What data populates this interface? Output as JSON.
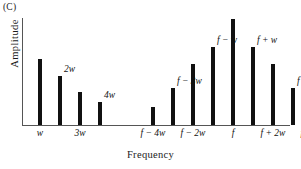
{
  "panel": {
    "label": "(C)"
  },
  "axes": {
    "ylabel": "Amplitude",
    "xlabel": "Frequency"
  },
  "chart_data": {
    "type": "bar",
    "title": "",
    "subtitle": "",
    "xlabel": "Frequency",
    "ylabel": "Amplitude",
    "ylim": [
      0,
      100
    ],
    "grid": false,
    "legend": null,
    "annotations": [
      "(C)"
    ],
    "categories": [
      "w",
      "2w",
      "3w",
      "4w",
      "f - 4w",
      "f - 3w",
      "f - 2w",
      "f - w",
      "f",
      "f + w",
      "f + 2w",
      "f + 3w",
      "f + 4w"
    ],
    "values": [
      62,
      46,
      31,
      22,
      17,
      35,
      58,
      74,
      100,
      74,
      58,
      35,
      17
    ],
    "tick_labels_below": [
      "w",
      "3w",
      "f - 4w",
      "f - 2w",
      "f",
      "f + 2w",
      "f + 4w"
    ],
    "labels_above": [
      "2w",
      "4w",
      "f - 3w",
      "f - w",
      "f + w",
      "f + 3w"
    ],
    "groups": [
      {
        "name": "baseband",
        "categories": [
          "w",
          "2w",
          "3w",
          "4w"
        ]
      },
      {
        "name": "carrier-sidebands",
        "categories": [
          "f - 4w",
          "f - 3w",
          "f - 2w",
          "f - w",
          "f",
          "f + w",
          "f + 2w",
          "f + 3w",
          "f + 4w"
        ]
      }
    ]
  },
  "bars": [
    {
      "name": "w",
      "label": "w",
      "value": 62,
      "x": 18,
      "label_pos": "below"
    },
    {
      "name": "2w",
      "label": "2w",
      "value": 46,
      "x": 38,
      "label_pos": "above"
    },
    {
      "name": "3w",
      "label": "3w",
      "value": 31,
      "x": 58,
      "label_pos": "below"
    },
    {
      "name": "4w",
      "label": "4w",
      "value": 22,
      "x": 78,
      "label_pos": "above"
    },
    {
      "name": "f-4w",
      "label": "f − 4w",
      "value": 17,
      "x": 131,
      "label_pos": "below"
    },
    {
      "name": "f-3w",
      "label": "f − 3w",
      "value": 35,
      "x": 151,
      "label_pos": "above"
    },
    {
      "name": "f-2w",
      "label": "f − 2w",
      "value": 58,
      "x": 171,
      "label_pos": "below"
    },
    {
      "name": "f-w",
      "label": "f − w",
      "value": 74,
      "x": 191,
      "label_pos": "above"
    },
    {
      "name": "f",
      "label": "f",
      "value": 100,
      "x": 211,
      "label_pos": "below"
    },
    {
      "name": "f+w",
      "label": "f + w",
      "value": 74,
      "x": 231,
      "label_pos": "above"
    },
    {
      "name": "f+2w",
      "label": "f + 2w",
      "value": 58,
      "x": 251,
      "label_pos": "below"
    },
    {
      "name": "f+3w",
      "label": "f + 3w",
      "value": 35,
      "x": 271,
      "label_pos": "above"
    },
    {
      "name": "f+4w",
      "label": "f + 4w",
      "value": 17,
      "x": 291,
      "label_pos": "below"
    }
  ],
  "style": {
    "bar_color": "#111111",
    "axis_color": "#555555",
    "text_color": "#1a1a1a",
    "background": "#ffffff"
  }
}
